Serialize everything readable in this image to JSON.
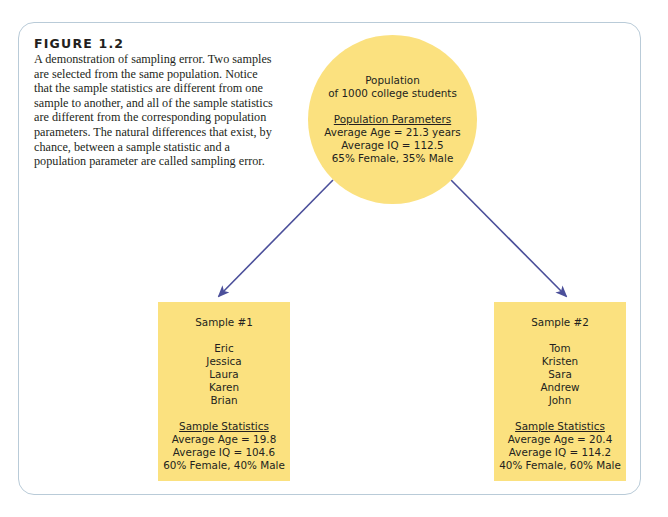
{
  "figure": {
    "title": "FIGURE 1.2",
    "caption": "A demonstration of sampling error. Two samples are selected from the same population. Notice that the sample statistics are different from one sample to another, and all of the sample statistics are different from the corresponding population parameters. The natural differences that exist, by chance, between a sample statistic and a population parameter are called sampling error."
  },
  "population": {
    "title": "Population",
    "subtitle": "of 1000 college students",
    "params_heading": "Population Parameters",
    "params": [
      "Average Age = 21.3 years",
      "Average IQ = 112.5",
      "65% Female, 35% Male"
    ]
  },
  "samples": [
    {
      "title": "Sample #1",
      "names": [
        "Eric",
        "Jessica",
        "Laura",
        "Karen",
        "Brian"
      ],
      "stats_heading": "Sample Statistics",
      "stats": [
        "Average Age = 19.8",
        "Average IQ = 104.6",
        "60% Female, 40% Male"
      ]
    },
    {
      "title": "Sample #2",
      "names": [
        "Tom",
        "Kristen",
        "Sara",
        "Andrew",
        "John"
      ],
      "stats_heading": "Sample Statistics",
      "stats": [
        "Average Age = 20.4",
        "Average IQ = 114.2",
        "40% Female, 60% Male"
      ]
    }
  ],
  "colors": {
    "fill": "#fbe17f",
    "arrow": "#4b4f9a",
    "frame_border": "#b9cbd8",
    "text": "#231f20"
  }
}
